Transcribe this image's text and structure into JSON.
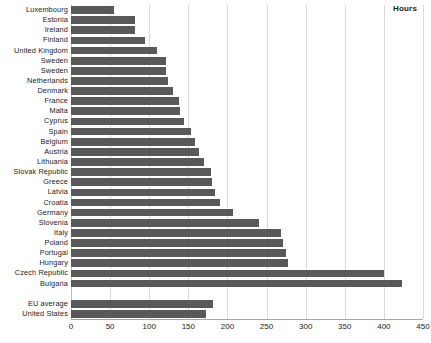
{
  "legend": {
    "label": "Hours"
  },
  "chart_data": {
    "type": "bar",
    "orientation": "horizontal",
    "title": "",
    "xlabel": "",
    "ylabel": "",
    "xlim": [
      0,
      450
    ],
    "xticks": [
      0,
      50,
      100,
      150,
      200,
      250,
      300,
      350,
      400,
      450
    ],
    "grid": true,
    "legend_position": "top-right",
    "legend_entries": [
      "Hours"
    ],
    "bar_color": "#595959",
    "units": "Hours",
    "categories": [
      "Luxembourg",
      "Estonia",
      "Ireland",
      "Finland",
      "United Kingdom",
      "Sweden",
      "Sweden",
      "Netherlands",
      "Denmark",
      "France",
      "Malta",
      "Cyprus",
      "Spain",
      "Belgium",
      "Austria",
      "Lithuania",
      "Slovak Republic",
      "Greece",
      "Latvia",
      "Croatia",
      "Germany",
      "Slovenia",
      "Italy",
      "Poland",
      "Portugal",
      "Hungary",
      "Czech Republic",
      "Bulgaria",
      "",
      "EU average",
      "United States"
    ],
    "values": [
      55,
      82,
      82,
      94,
      110,
      122,
      122,
      124,
      131,
      138,
      139,
      145,
      153,
      158,
      163,
      170,
      179,
      180,
      184,
      191,
      207,
      240,
      269,
      271,
      275,
      277,
      400,
      423,
      null,
      182,
      172
    ]
  }
}
